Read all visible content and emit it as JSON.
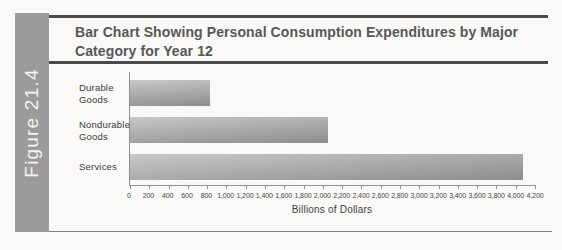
{
  "figure_label": "Figure 21.4",
  "title": "Bar Chart Showing Personal Consumption Expenditures by Major Category for Year 12",
  "chart_data": {
    "type": "bar",
    "orientation": "horizontal",
    "title": "Bar Chart Showing Personal Consumption Expenditures by Major Category for Year 12",
    "categories": [
      "Durable Goods",
      "Nondurable Goods",
      "Services"
    ],
    "category_label_lines": [
      [
        "Durable",
        "Goods"
      ],
      [
        "Nondurable",
        "Goods"
      ],
      [
        "Services"
      ]
    ],
    "values": [
      830,
      2050,
      4080
    ],
    "xlabel": "Billions of Dollars",
    "ylabel": "",
    "xlim": [
      0,
      4200
    ],
    "xtick_interval": 200,
    "xtick_labels": [
      "0",
      "200",
      "400",
      "600",
      "800",
      "1,000",
      "1,200",
      "1,400",
      "1,600",
      "1,800",
      "2,000",
      "2,200",
      "2,400",
      "2,600",
      "2,800",
      "3,000",
      "3,200",
      "3,400",
      "3,600",
      "3,800",
      "4,000",
      "4,200"
    ],
    "grid": false,
    "legend": "none"
  },
  "colors": {
    "sidebar_bg": "#9b9b9b",
    "sidebar_text": "#f3f3f2",
    "rule": "#4a4a4a",
    "title_text": "#575757",
    "bar_top": "#c8c8c8",
    "bar_bottom": "#8d8d8d",
    "axis": "#8f8f8f"
  }
}
